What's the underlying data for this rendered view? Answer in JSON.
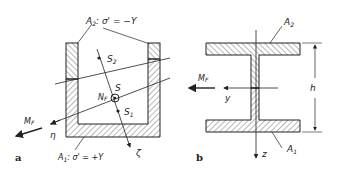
{
  "figure_a": {
    "label": "a",
    "top_area": {
      "name": "A",
      "sub": "2",
      "rest": ": σ' = −Y"
    },
    "bottom_area": {
      "name": "A",
      "sub": "1",
      "rest": ": σ' = +Y"
    },
    "point_s2": {
      "name": "S",
      "sub": "2"
    },
    "point_s": {
      "name": "S"
    },
    "point_s1": {
      "name": "S",
      "sub": "1"
    },
    "normal_force": {
      "name": "N",
      "sub": "F"
    },
    "moment": {
      "name": "M",
      "sub": "F"
    },
    "axis_eta": "η",
    "axis_zeta": "ζ"
  },
  "figure_b": {
    "label": "b",
    "top_area": {
      "name": "A",
      "sub": "2"
    },
    "bottom_area": {
      "name": "A",
      "sub": "1"
    },
    "moment": {
      "name": "M",
      "sub": "F"
    },
    "axis_y": "y",
    "axis_z": "z",
    "height": "h"
  },
  "colors": {
    "line": "#222222",
    "hatch": "#333333",
    "background": "#ffffff"
  }
}
